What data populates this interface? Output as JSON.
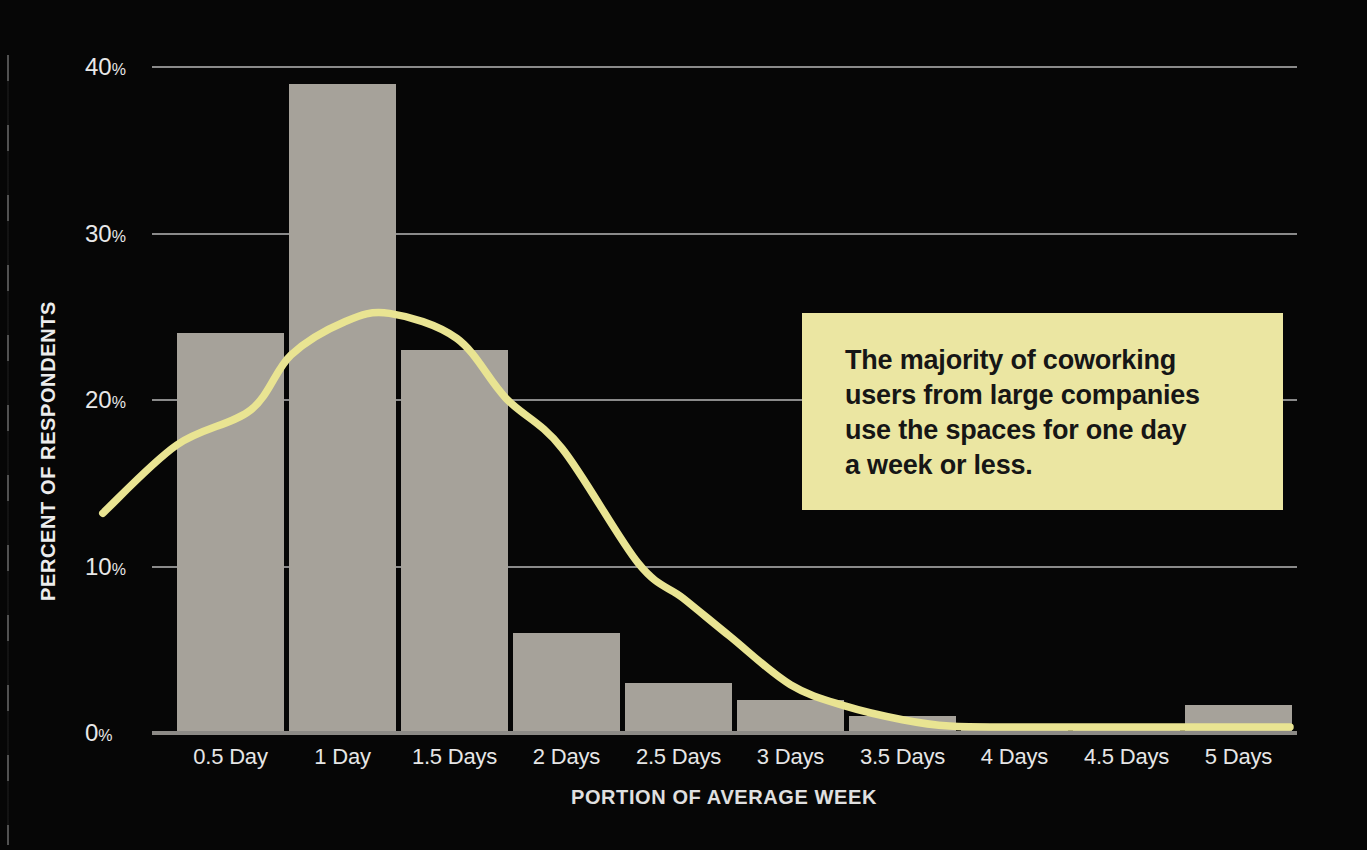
{
  "chart_data": {
    "type": "bar",
    "title": "",
    "xlabel": "PORTION OF AVERAGE WEEK",
    "ylabel": "PERCENT OF RESPONDENTS",
    "categories": [
      "0.5 Day",
      "1 Day",
      "1.5 Days",
      "2 Days",
      "2.5 Days",
      "3 Days",
      "3.5 Days",
      "4 Days",
      "4.5 Days",
      "5 Days"
    ],
    "values": [
      24,
      39,
      23,
      6,
      3,
      2,
      1,
      0.4,
      0.4,
      1.7
    ],
    "ylim": [
      0,
      40
    ],
    "yticks": [
      40,
      30,
      20,
      10,
      0
    ],
    "ytick_suffix": "%",
    "grid": true,
    "legend": false,
    "colors": {
      "background": "#060606",
      "bar": "#a6a29a",
      "gridline": "#8a8a8a",
      "axis_line": "#8c8a86",
      "axis_text": "#e8e8e8",
      "curve": "#e9e492"
    },
    "trend_curve": {
      "name": "smoothed-distribution-curve",
      "points_days_pct": [
        [
          -0.08,
          13.2
        ],
        [
          0.25,
          17.3
        ],
        [
          0.58,
          19.4
        ],
        [
          0.76,
          22.7
        ],
        [
          1.0,
          24.7
        ],
        [
          1.2,
          25.2
        ],
        [
          1.5,
          23.7
        ],
        [
          1.72,
          20.1
        ],
        [
          1.97,
          17.1
        ],
        [
          2.31,
          10.2
        ],
        [
          2.51,
          8.1
        ],
        [
          2.72,
          5.8
        ],
        [
          2.99,
          2.9
        ],
        [
          3.24,
          1.6
        ],
        [
          3.49,
          0.8
        ],
        [
          3.7,
          0.42
        ],
        [
          4.02,
          0.36
        ],
        [
          4.55,
          0.36
        ],
        [
          5.22,
          0.36
        ]
      ]
    },
    "annotation": {
      "text": "The majority of coworking\nusers from large companies\nuse the spaces for one day\na week or less.",
      "bg_color": "#ebe6a2",
      "text_color": "#161616"
    }
  }
}
